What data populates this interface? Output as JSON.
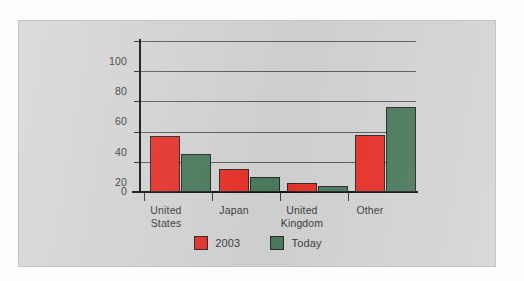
{
  "chart_data": {
    "type": "bar",
    "title": "",
    "xlabel": "",
    "ylabel": "",
    "ylim": [
      0,
      100
    ],
    "yticks": [
      0,
      20,
      40,
      60,
      80,
      100
    ],
    "grid": true,
    "legend_position": "bottom",
    "categories": [
      "United States",
      "Japan",
      "United Kingdom",
      "Other"
    ],
    "series": [
      {
        "name": "2003",
        "color": "#e9322b",
        "values": [
          37,
          15,
          6,
          38
        ]
      },
      {
        "name": "Today",
        "color": "#4c7c5e",
        "values": [
          25,
          10,
          4,
          56
        ]
      }
    ]
  },
  "axis": {
    "tick_labels": [
      "100",
      "80",
      "60",
      "40",
      "20",
      "0"
    ]
  },
  "categories": [
    {
      "line1": "United",
      "line2": "States"
    },
    {
      "line1": "Japan",
      "line2": ""
    },
    {
      "line1": "United",
      "line2": "Kingdom"
    },
    {
      "line1": "Other",
      "line2": ""
    }
  ],
  "legend": [
    {
      "label": "2003",
      "color": "#e9322b"
    },
    {
      "label": "Today",
      "color": "#4c7c5e"
    }
  ],
  "colors": {
    "series_2003": "#e9322b",
    "series_today": "#4c7c5e",
    "panel_background": "#d5d5d5",
    "axis": "#141414",
    "gridline": "#5d5d5d",
    "text": "#3b3b3b"
  }
}
